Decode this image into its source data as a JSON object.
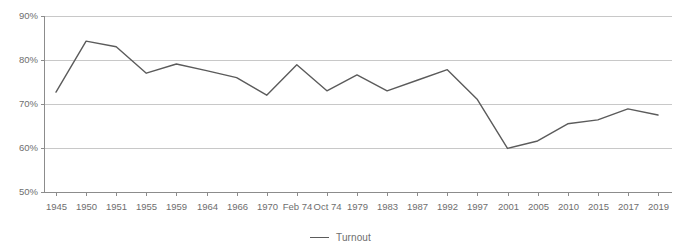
{
  "chart_data": {
    "type": "line",
    "title": "",
    "xlabel": "",
    "ylabel": "",
    "ylim": [
      50,
      90
    ],
    "ytick_values": [
      50,
      60,
      70,
      80,
      90
    ],
    "ytick_labels": [
      "50%",
      "60%",
      "70%",
      "80%",
      "90%"
    ],
    "grid": true,
    "legend_position": "bottom-center",
    "categories": [
      "1945",
      "1950",
      "1951",
      "1955",
      "1959",
      "1964",
      "1966",
      "1970",
      "Feb 74",
      "Oct 74",
      "1979",
      "1983",
      "1987",
      "1992",
      "1997",
      "2001",
      "2005",
      "2010",
      "2015",
      "2017",
      "2019"
    ],
    "series": [
      {
        "name": "Turnout",
        "color": "#5b5b5b",
        "values": [
          72.7,
          84.3,
          83.0,
          77.0,
          79.1,
          77.6,
          76.0,
          72.0,
          78.9,
          73.0,
          76.6,
          73.0,
          75.4,
          77.8,
          71.0,
          59.9,
          61.6,
          65.5,
          66.4,
          68.9,
          67.5
        ]
      }
    ],
    "annotations": []
  },
  "legend": {
    "entries": [
      {
        "label": "Turnout"
      }
    ]
  },
  "axis": {
    "y_labels": [
      "90%",
      "80%",
      "70%",
      "60%",
      "50%"
    ],
    "x_labels": [
      "1945",
      "1950",
      "1951",
      "1955",
      "1959",
      "1964",
      "1966",
      "1970",
      "Feb 74",
      "Oct 74",
      "1979",
      "1983",
      "1987",
      "1992",
      "1997",
      "2001",
      "2005",
      "2010",
      "2015",
      "2017",
      "2019"
    ]
  }
}
